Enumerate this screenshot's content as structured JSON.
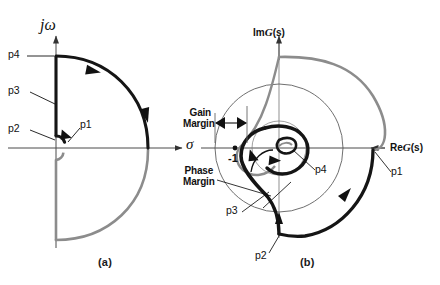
{
  "figure": {
    "type": "nyquist-contour-and-plot",
    "panels": [
      {
        "id": "a",
        "caption": "(a)",
        "title": "Nyquist contour in the s-plane",
        "axes": {
          "vertical_label_im": "j",
          "vertical_label_omega": "ω",
          "horizontal_label": "σ"
        },
        "point_labels": [
          {
            "name": "p1",
            "text": "p1"
          },
          {
            "name": "p2",
            "text": "p2"
          },
          {
            "name": "p3",
            "text": "p3"
          },
          {
            "name": "p4",
            "text": "p4"
          }
        ]
      },
      {
        "id": "b",
        "caption": "(b)",
        "title": "Nyquist plot in the G(s)-plane",
        "axes": {
          "vertical_label_prefix": "Im",
          "vertical_label_func": "G",
          "vertical_label_suffix": "(s)",
          "horizontal_label_prefix": "Re",
          "horizontal_label_func": "G",
          "horizontal_label_suffix": "(s)"
        },
        "critical_point": "-1",
        "annotations": [
          {
            "name": "gain-margin",
            "line1": "Gain",
            "line2": "Margin"
          },
          {
            "name": "phase-margin",
            "line1": "Phase",
            "line2": "Margin"
          }
        ],
        "point_labels": [
          {
            "name": "p1",
            "text": "p1"
          },
          {
            "name": "p2",
            "text": "p2"
          },
          {
            "name": "p3",
            "text": "p3"
          },
          {
            "name": "p4",
            "text": "p4"
          }
        ]
      }
    ]
  },
  "colors": {
    "ink": "#111111",
    "curve_dark": "#151515",
    "curve_gray": "#8c8c8c",
    "axis": "#4a4a4a",
    "thin_circle": "#555555",
    "background": "#ffffff"
  }
}
